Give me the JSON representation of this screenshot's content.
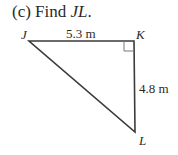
{
  "problem": {
    "prefix": "(c) Find ",
    "target": "JL",
    "suffix": "."
  },
  "diagram": {
    "vertices": {
      "J": {
        "label": "J",
        "x": 29,
        "y": 41
      },
      "K": {
        "label": "K",
        "x": 134,
        "y": 41
      },
      "L": {
        "label": "L",
        "x": 135,
        "y": 132
      }
    },
    "sides": {
      "JK": "5.3 m",
      "KL": "4.8 m"
    },
    "right_angle_at": "K",
    "line_color": "#3a3a3a"
  }
}
